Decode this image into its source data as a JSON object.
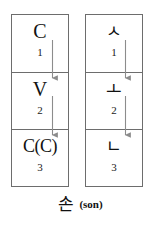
{
  "figure": {
    "columns": [
      {
        "id": "structure",
        "name": "abstract-structure-column",
        "cells": [
          {
            "symbol": "C",
            "index": "1"
          },
          {
            "symbol": "V",
            "index": "2"
          },
          {
            "symbol": "C(C)",
            "index": "3"
          }
        ]
      },
      {
        "id": "example",
        "name": "hangul-example-column",
        "cells": [
          {
            "symbol": "ㅅ",
            "index": "1"
          },
          {
            "symbol": "ㅗ",
            "index": "2"
          },
          {
            "symbol": "ㄴ",
            "index": "3"
          }
        ]
      }
    ],
    "arrows": [
      {
        "column": "structure",
        "from_cell": 1,
        "to_cell": 2
      },
      {
        "column": "structure",
        "from_cell": 2,
        "to_cell": 3
      },
      {
        "column": "example",
        "from_cell": 1,
        "to_cell": 2
      },
      {
        "column": "example",
        "from_cell": 2,
        "to_cell": 3
      }
    ],
    "caption": {
      "hangul": "손",
      "romanization": "(son)"
    },
    "colors": {
      "border": "#6d6d6d",
      "arrow": "#8c8c8c",
      "text": "#111111",
      "background": "#ffffff"
    }
  }
}
